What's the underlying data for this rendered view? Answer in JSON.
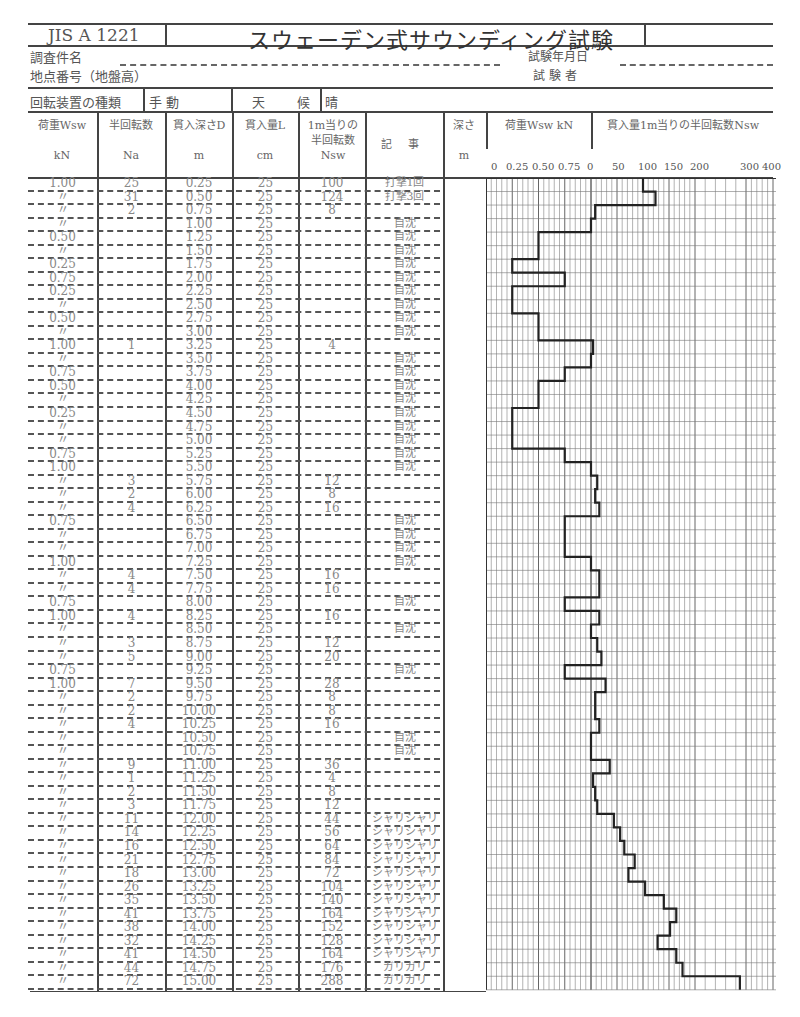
{
  "header": {
    "standard": "JIS A 1221",
    "title": "スウェーデン式サウンディング試験",
    "project_label": "調査件名",
    "location_label": "地点番号（地盤高）",
    "date_label": "試験年月日",
    "tester_label": "試 験 者",
    "device_label": "回転装置の種類",
    "device_value": "手 動",
    "weather_label": "天 候",
    "weather_value": "晴"
  },
  "columns": {
    "load": {
      "label": "荷重Wsw",
      "unit": "kN"
    },
    "half_turns": {
      "label": "半回転数",
      "unit": "Na"
    },
    "depth": {
      "label": "貫入深さD",
      "unit": "m"
    },
    "penetration": {
      "label": "貫入量L",
      "unit": "cm"
    },
    "nsw": {
      "label": "1m当りの半回転数",
      "unit": "Nsw"
    },
    "notes": {
      "label": "記 事"
    },
    "depth_axis": {
      "label": "深さ",
      "unit": "m"
    },
    "load_chart": {
      "label": "荷重Wsw kN",
      "ticks": [
        "0",
        "0.25",
        "0.50",
        "0.75"
      ]
    },
    "nsw_chart": {
      "label": "貫入量1m当りの半回転数Nsw",
      "ticks": [
        "0",
        "50",
        "100",
        "150",
        "200",
        "300",
        "400"
      ]
    }
  },
  "rows": [
    {
      "w": "1.00",
      "na": "25",
      "d": "0.25",
      "l": "25",
      "nsw": "100",
      "note": "打撃1回"
    },
    {
      "w": "〃",
      "na": "31",
      "d": "0.50",
      "l": "25",
      "nsw": "124",
      "note": "打撃3回"
    },
    {
      "w": "〃",
      "na": "2",
      "d": "0.75",
      "l": "25",
      "nsw": "8",
      "note": ""
    },
    {
      "w": "〃",
      "na": "",
      "d": "1.00",
      "l": "25",
      "nsw": "",
      "note": "自沈"
    },
    {
      "w": "0.50",
      "na": "",
      "d": "1.25",
      "l": "25",
      "nsw": "",
      "note": "自沈"
    },
    {
      "w": "〃",
      "na": "",
      "d": "1.50",
      "l": "25",
      "nsw": "",
      "note": "自沈"
    },
    {
      "w": "0.25",
      "na": "",
      "d": "1.75",
      "l": "25",
      "nsw": "",
      "note": "自沈"
    },
    {
      "w": "0.75",
      "na": "",
      "d": "2.00",
      "l": "25",
      "nsw": "",
      "note": "自沈"
    },
    {
      "w": "0.25",
      "na": "",
      "d": "2.25",
      "l": "25",
      "nsw": "",
      "note": "自沈"
    },
    {
      "w": "〃",
      "na": "",
      "d": "2.50",
      "l": "25",
      "nsw": "",
      "note": "自沈"
    },
    {
      "w": "0.50",
      "na": "",
      "d": "2.75",
      "l": "25",
      "nsw": "",
      "note": "自沈"
    },
    {
      "w": "〃",
      "na": "",
      "d": "3.00",
      "l": "25",
      "nsw": "",
      "note": "自沈"
    },
    {
      "w": "1.00",
      "na": "1",
      "d": "3.25",
      "l": "25",
      "nsw": "4",
      "note": ""
    },
    {
      "w": "〃",
      "na": "",
      "d": "3.50",
      "l": "25",
      "nsw": "",
      "note": "自沈"
    },
    {
      "w": "0.75",
      "na": "",
      "d": "3.75",
      "l": "25",
      "nsw": "",
      "note": "自沈"
    },
    {
      "w": "0.50",
      "na": "",
      "d": "4.00",
      "l": "25",
      "nsw": "",
      "note": "自沈"
    },
    {
      "w": "〃",
      "na": "",
      "d": "4.25",
      "l": "25",
      "nsw": "",
      "note": "自沈"
    },
    {
      "w": "0.25",
      "na": "",
      "d": "4.50",
      "l": "25",
      "nsw": "",
      "note": "自沈"
    },
    {
      "w": "〃",
      "na": "",
      "d": "4.75",
      "l": "25",
      "nsw": "",
      "note": "自沈"
    },
    {
      "w": "〃",
      "na": "",
      "d": "5.00",
      "l": "25",
      "nsw": "",
      "note": "自沈"
    },
    {
      "w": "0.75",
      "na": "",
      "d": "5.25",
      "l": "25",
      "nsw": "",
      "note": "自沈"
    },
    {
      "w": "1.00",
      "na": "",
      "d": "5.50",
      "l": "25",
      "nsw": "",
      "note": "自沈"
    },
    {
      "w": "〃",
      "na": "3",
      "d": "5.75",
      "l": "25",
      "nsw": "12",
      "note": ""
    },
    {
      "w": "〃",
      "na": "2",
      "d": "6.00",
      "l": "25",
      "nsw": "8",
      "note": ""
    },
    {
      "w": "〃",
      "na": "4",
      "d": "6.25",
      "l": "25",
      "nsw": "16",
      "note": ""
    },
    {
      "w": "0.75",
      "na": "",
      "d": "6.50",
      "l": "25",
      "nsw": "",
      "note": "自沈"
    },
    {
      "w": "〃",
      "na": "",
      "d": "6.75",
      "l": "25",
      "nsw": "",
      "note": "自沈"
    },
    {
      "w": "〃",
      "na": "",
      "d": "7.00",
      "l": "25",
      "nsw": "",
      "note": "自沈"
    },
    {
      "w": "1.00",
      "na": "",
      "d": "7.25",
      "l": "25",
      "nsw": "",
      "note": "自沈"
    },
    {
      "w": "〃",
      "na": "4",
      "d": "7.50",
      "l": "25",
      "nsw": "16",
      "note": ""
    },
    {
      "w": "〃",
      "na": "4",
      "d": "7.75",
      "l": "25",
      "nsw": "16",
      "note": ""
    },
    {
      "w": "0.75",
      "na": "",
      "d": "8.00",
      "l": "25",
      "nsw": "",
      "note": "自沈"
    },
    {
      "w": "1.00",
      "na": "4",
      "d": "8.25",
      "l": "25",
      "nsw": "16",
      "note": ""
    },
    {
      "w": "〃",
      "na": "",
      "d": "8.50",
      "l": "25",
      "nsw": "",
      "note": "自沈"
    },
    {
      "w": "〃",
      "na": "3",
      "d": "8.75",
      "l": "25",
      "nsw": "12",
      "note": ""
    },
    {
      "w": "〃",
      "na": "5",
      "d": "9.00",
      "l": "25",
      "nsw": "20",
      "note": ""
    },
    {
      "w": "0.75",
      "na": "",
      "d": "9.25",
      "l": "25",
      "nsw": "",
      "note": "自沈"
    },
    {
      "w": "1.00",
      "na": "7",
      "d": "9.50",
      "l": "25",
      "nsw": "28",
      "note": ""
    },
    {
      "w": "〃",
      "na": "2",
      "d": "9.75",
      "l": "25",
      "nsw": "8",
      "note": ""
    },
    {
      "w": "〃",
      "na": "2",
      "d": "10.00",
      "l": "25",
      "nsw": "8",
      "note": ""
    },
    {
      "w": "〃",
      "na": "4",
      "d": "10.25",
      "l": "25",
      "nsw": "16",
      "note": ""
    },
    {
      "w": "〃",
      "na": "",
      "d": "10.50",
      "l": "25",
      "nsw": "",
      "note": "自沈"
    },
    {
      "w": "〃",
      "na": "",
      "d": "10.75",
      "l": "25",
      "nsw": "",
      "note": "自沈"
    },
    {
      "w": "〃",
      "na": "9",
      "d": "11.00",
      "l": "25",
      "nsw": "36",
      "note": ""
    },
    {
      "w": "〃",
      "na": "1",
      "d": "11.25",
      "l": "25",
      "nsw": "4",
      "note": ""
    },
    {
      "w": "〃",
      "na": "2",
      "d": "11.50",
      "l": "25",
      "nsw": "8",
      "note": ""
    },
    {
      "w": "〃",
      "na": "3",
      "d": "11.75",
      "l": "25",
      "nsw": "12",
      "note": ""
    },
    {
      "w": "〃",
      "na": "11",
      "d": "12.00",
      "l": "25",
      "nsw": "44",
      "note": "シャリシャリ"
    },
    {
      "w": "〃",
      "na": "14",
      "d": "12.25",
      "l": "25",
      "nsw": "56",
      "note": "シャリシャリ"
    },
    {
      "w": "〃",
      "na": "16",
      "d": "12.50",
      "l": "25",
      "nsw": "64",
      "note": "シャリシャリ"
    },
    {
      "w": "〃",
      "na": "21",
      "d": "12.75",
      "l": "25",
      "nsw": "84",
      "note": "シャリシャリ"
    },
    {
      "w": "〃",
      "na": "18",
      "d": "13.00",
      "l": "25",
      "nsw": "72",
      "note": "シャリシャリ"
    },
    {
      "w": "〃",
      "na": "26",
      "d": "13.25",
      "l": "25",
      "nsw": "104",
      "note": "シャリシャリ"
    },
    {
      "w": "〃",
      "na": "35",
      "d": "13.50",
      "l": "25",
      "nsw": "140",
      "note": "シャリシャリ"
    },
    {
      "w": "〃",
      "na": "41",
      "d": "13.75",
      "l": "25",
      "nsw": "164",
      "note": "シャリシャリ"
    },
    {
      "w": "〃",
      "na": "38",
      "d": "14.00",
      "l": "25",
      "nsw": "152",
      "note": "シャリシャリ"
    },
    {
      "w": "〃",
      "na": "32",
      "d": "14.25",
      "l": "25",
      "nsw": "128",
      "note": "シャリシャリ"
    },
    {
      "w": "〃",
      "na": "41",
      "d": "14.50",
      "l": "25",
      "nsw": "164",
      "note": "シャリシャリ"
    },
    {
      "w": "〃",
      "na": "44",
      "d": "14.75",
      "l": "25",
      "nsw": "176",
      "note": "ガリガリ"
    },
    {
      "w": "〃",
      "na": "72",
      "d": "15.00",
      "l": "25",
      "nsw": "288",
      "note": "ガリガリ"
    }
  ],
  "chart_data": {
    "type": "line",
    "title": "スウェーデン式サウンディング試験",
    "xlabel": "荷重Wsw kN / 貫入量1m当りの半回転数Nsw",
    "ylabel": "深さ m",
    "depth": [
      0.25,
      0.5,
      0.75,
      1.0,
      1.25,
      1.5,
      1.75,
      2.0,
      2.25,
      2.5,
      2.75,
      3.0,
      3.25,
      3.5,
      3.75,
      4.0,
      4.25,
      4.5,
      4.75,
      5.0,
      5.25,
      5.5,
      5.75,
      6.0,
      6.25,
      6.5,
      6.75,
      7.0,
      7.25,
      7.5,
      7.75,
      8.0,
      8.25,
      8.5,
      8.75,
      9.0,
      9.25,
      9.5,
      9.75,
      10.0,
      10.25,
      10.5,
      10.75,
      11.0,
      11.25,
      11.5,
      11.75,
      12.0,
      12.25,
      12.5,
      12.75,
      13.0,
      13.25,
      13.5,
      13.75,
      14.0,
      14.25,
      14.5,
      14.75,
      15.0
    ],
    "series": [
      {
        "name": "Wsw (kN)",
        "values": [
          1,
          1,
          1,
          1,
          0.5,
          0.5,
          0.25,
          0.75,
          0.25,
          0.25,
          0.5,
          0.5,
          1,
          1,
          0.75,
          0.5,
          0.5,
          0.25,
          0.25,
          0.25,
          0.75,
          1,
          1,
          1,
          1,
          0.75,
          0.75,
          0.75,
          1,
          1,
          1,
          0.75,
          1,
          1,
          1,
          1,
          0.75,
          1,
          1,
          1,
          1,
          1,
          1,
          1,
          1,
          1,
          1,
          1,
          1,
          1,
          1,
          1,
          1,
          1,
          1,
          1,
          1,
          1,
          1,
          1
        ]
      },
      {
        "name": "Nsw",
        "values": [
          100,
          124,
          8,
          0,
          0,
          0,
          0,
          0,
          0,
          0,
          0,
          0,
          4,
          0,
          0,
          0,
          0,
          0,
          0,
          0,
          0,
          0,
          12,
          8,
          16,
          0,
          0,
          0,
          0,
          16,
          16,
          0,
          16,
          0,
          12,
          20,
          0,
          28,
          8,
          8,
          16,
          0,
          0,
          36,
          4,
          8,
          12,
          44,
          56,
          64,
          84,
          72,
          104,
          140,
          164,
          152,
          128,
          164,
          176,
          288
        ]
      }
    ],
    "load_axis": {
      "ticks": [
        0,
        0.25,
        0.5,
        0.75,
        1.0
      ],
      "range": [
        0,
        1.0
      ]
    },
    "nsw_axis": {
      "ticks": [
        0,
        50,
        100,
        150,
        200,
        300,
        400
      ],
      "range": [
        0,
        400
      ]
    },
    "grid": true
  }
}
